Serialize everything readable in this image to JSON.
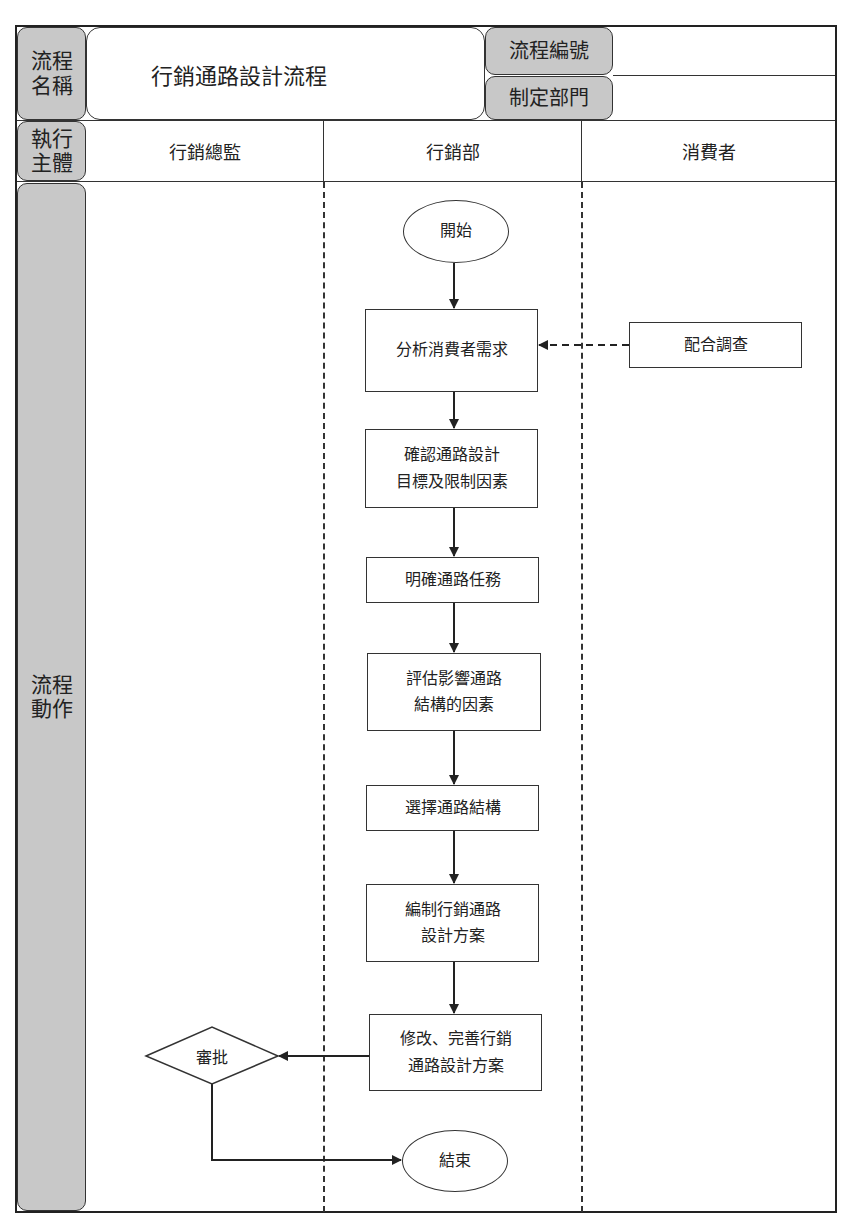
{
  "header": {
    "process_name_label": "流程\n名稱",
    "process_name_label_lines": [
      "流程",
      "名稱"
    ],
    "process_title": "行銷通路設計流程",
    "process_number_label": "流程編號",
    "process_number_value": "",
    "department_label": "制定部門",
    "department_value": ""
  },
  "executors": {
    "label_lines": [
      "執行",
      "主體"
    ],
    "lanes": [
      "行銷總監",
      "行銷部",
      "消費者"
    ]
  },
  "actions_label_lines": [
    "流程",
    "動作"
  ],
  "flow": {
    "start": "開始",
    "steps": [
      {
        "id": "s1",
        "lane": "行銷部",
        "lines": [
          "分析消費者需求"
        ]
      },
      {
        "id": "s2",
        "lane": "行銷部",
        "lines": [
          "確認通路設計",
          "目標及限制因素"
        ]
      },
      {
        "id": "s3",
        "lane": "行銷部",
        "lines": [
          "明確通路任務"
        ]
      },
      {
        "id": "s4",
        "lane": "行銷部",
        "lines": [
          "評估影響通路",
          "結構的因素"
        ]
      },
      {
        "id": "s5",
        "lane": "行銷部",
        "lines": [
          "選擇通路結構"
        ]
      },
      {
        "id": "s6",
        "lane": "行銷部",
        "lines": [
          "編制行銷通路",
          "設計方案"
        ]
      },
      {
        "id": "s7",
        "lane": "行銷部",
        "lines": [
          "修改、完善行銷",
          "通路設計方案"
        ]
      }
    ],
    "consumer_step": {
      "lane": "消費者",
      "label": "配合調查"
    },
    "decision": {
      "lane": "行銷總監",
      "label": "審批"
    },
    "end": "結束"
  },
  "colors": {
    "label_gray": "#c8c8c8",
    "line": "#333333",
    "background": "#ffffff"
  }
}
